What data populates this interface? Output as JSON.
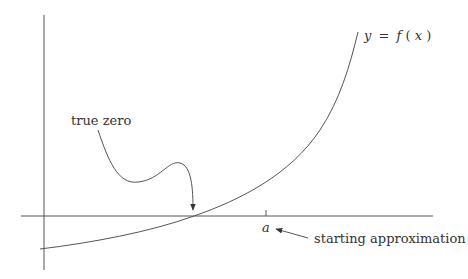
{
  "diagram": {
    "curve_label": "y = f(x)",
    "curve_label_parts": {
      "y": "y",
      "eq": "=",
      "f": "f",
      "lparen": "(",
      "x": "x",
      "rparen": ")"
    },
    "true_zero_label": "true zero",
    "tick_label": "a",
    "starting_label": "starting approximation",
    "colors": {
      "line": "#555555",
      "text": "#333333",
      "background": "#ffffff"
    }
  }
}
